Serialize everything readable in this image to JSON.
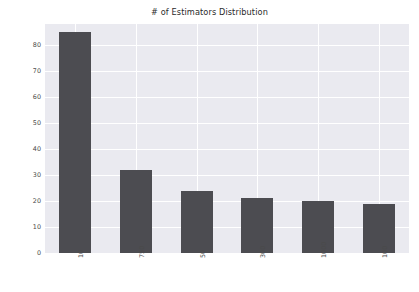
{
  "chart_data": {
    "type": "bar",
    "title": "# of Estimators Distribution",
    "xlabel": "",
    "ylabel": "",
    "categories": [
      "10",
      "750",
      "50",
      "300",
      "1000",
      "100"
    ],
    "values": [
      85,
      32,
      24,
      21,
      20,
      19
    ],
    "series": [
      {
        "name": "count",
        "values": [
          85,
          32,
          24,
          21,
          20,
          19
        ]
      }
    ],
    "ylim": [
      0,
      88
    ],
    "yticks": [
      0,
      10,
      20,
      30,
      40,
      50,
      60,
      70,
      80
    ],
    "ytick_labels": [
      "0",
      "10",
      "20",
      "30",
      "40",
      "50",
      "60",
      "70",
      "80"
    ],
    "xtick_rotation": 90,
    "grid": true,
    "grid_color": "#ffffff",
    "legend": null,
    "legend_position": "none",
    "bar_color": "#4c4c51",
    "plot_background": "#eaeaf0",
    "figure_background": "#ffffff"
  }
}
